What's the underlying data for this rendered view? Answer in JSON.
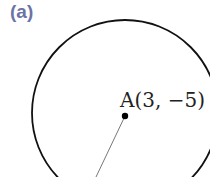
{
  "figure": {
    "label": "(a)",
    "label_color": "#6b73a6",
    "center_point": {
      "name": "A",
      "x": 3,
      "y": -5,
      "text": "A(3, −5)"
    },
    "circle": {
      "stroke": "#111111"
    },
    "radius_line": {
      "stroke": "#666666"
    }
  }
}
